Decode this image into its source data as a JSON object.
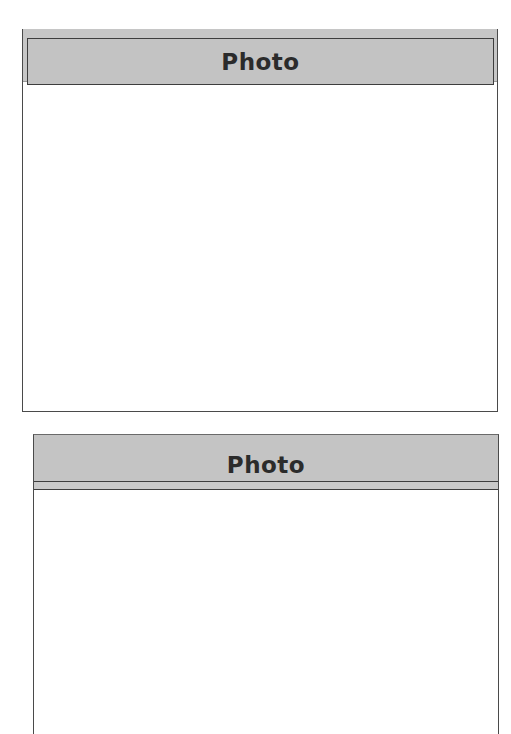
{
  "panels": [
    {
      "title": "Photo",
      "content": ""
    },
    {
      "title": "Photo",
      "content": ""
    }
  ],
  "colors": {
    "header_background": "#c4c4c4",
    "border": "#3d3d3d",
    "title_text": "#2b2b2b",
    "page_background": "#ffffff"
  }
}
